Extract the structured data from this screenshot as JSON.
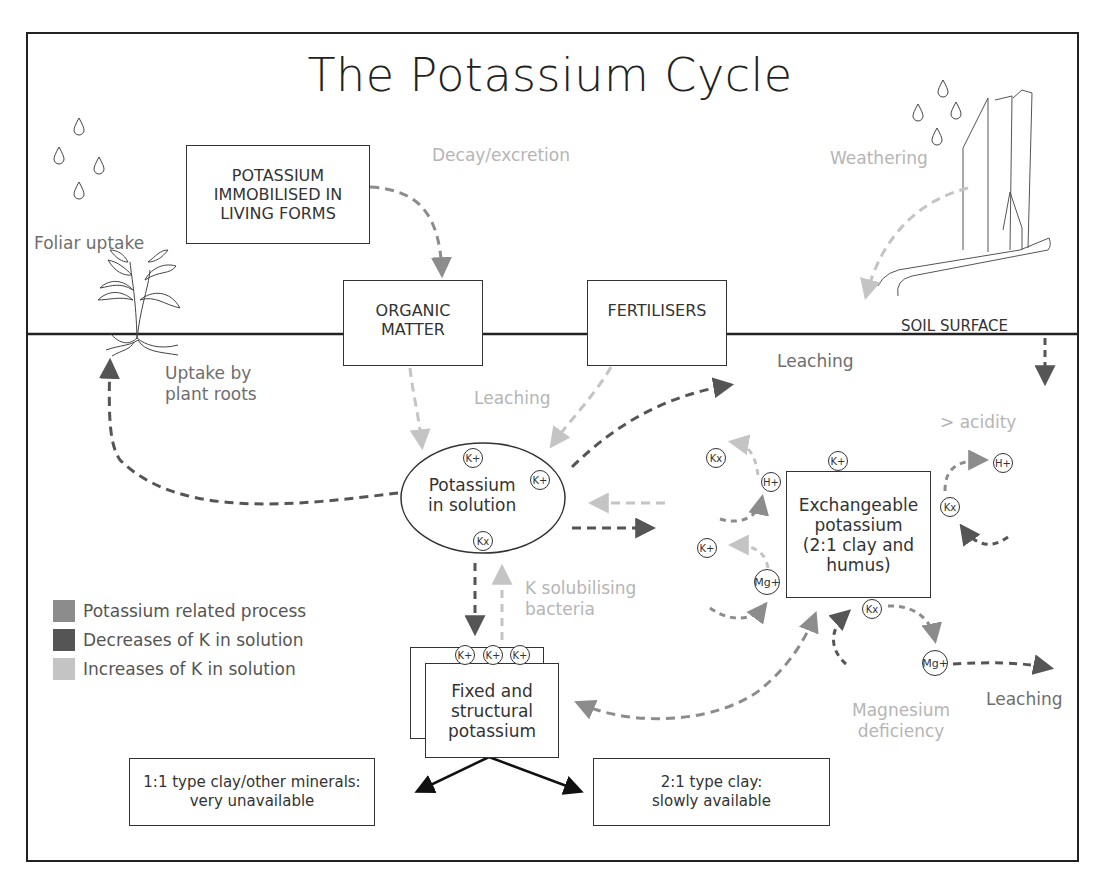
{
  "title": "The Potassium Cycle",
  "colors": {
    "potassium_related": "#8c8c8c",
    "decreases": "#555555",
    "increases": "#c4c4c4",
    "line": "#222222"
  },
  "boxes": {
    "immobilised": [
      "POTASSIUM",
      "IMMOBILISED IN",
      "LIVING FORMS"
    ],
    "organic_matter": [
      "ORGANIC",
      "MATTER"
    ],
    "fertilisers": "FERTILISERS",
    "solution": [
      "Potassium",
      "in solution"
    ],
    "exchangeable": [
      "Exchangeable",
      "potassium",
      "(2:1 clay and",
      "humus)"
    ],
    "fixed": [
      "Fixed and",
      "structural",
      "potassium"
    ],
    "clay_11": [
      "1:1 type clay/other minerals:",
      "very unavailable"
    ],
    "clay_21": [
      "2:1 type clay:",
      "slowly available"
    ]
  },
  "labels": {
    "decay": "Decay/excretion",
    "weathering": "Weathering",
    "foliar": "Foliar uptake",
    "uptake_roots": [
      "Uptake by",
      "plant roots"
    ],
    "soil_surface": "SOIL SURFACE",
    "leaching_top": "Leaching",
    "leaching_mid": "Leaching",
    "leaching_bottom": "Leaching",
    "acidity": "> acidity",
    "k_bacteria": [
      "K solubilising",
      "bacteria"
    ],
    "mg_deficiency": [
      "Magnesium",
      "deficiency"
    ]
  },
  "ions": {
    "k_plus": "K+",
    "h_plus": "H+",
    "mg_plus": "Mg+",
    "kx": "Kx"
  },
  "legend": [
    {
      "label": "Potassium related process",
      "color": "#8c8c8c"
    },
    {
      "label": "Decreases of K in solution",
      "color": "#555555"
    },
    {
      "label": "Increases of K in solution",
      "color": "#c4c4c4"
    }
  ]
}
